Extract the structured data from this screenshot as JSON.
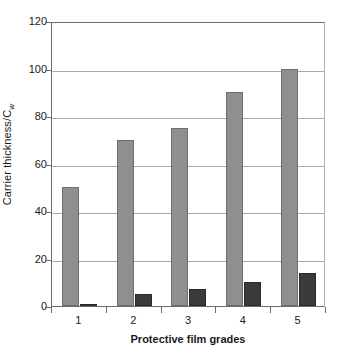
{
  "chart_data": {
    "type": "bar",
    "title": "",
    "xlabel": "Protective film grades",
    "ylabel": "Carrier thickness/C",
    "ylabel_subscript": "w",
    "categories": [
      "1",
      "2",
      "3",
      "4",
      "5"
    ],
    "series": [
      {
        "name": "series-a",
        "color": "#8f8f8f",
        "values": [
          50,
          70,
          75,
          90,
          100
        ]
      },
      {
        "name": "series-b",
        "color": "#3a3a3a",
        "values": [
          1,
          5,
          7,
          10,
          14
        ]
      }
    ],
    "ylim": [
      0,
      120
    ],
    "yticks": [
      0,
      20,
      40,
      60,
      80,
      100,
      120
    ],
    "ytick_labels": [
      "0",
      "20",
      "40",
      "60",
      "80",
      "100",
      "120"
    ],
    "grid": true,
    "legend": "none"
  }
}
